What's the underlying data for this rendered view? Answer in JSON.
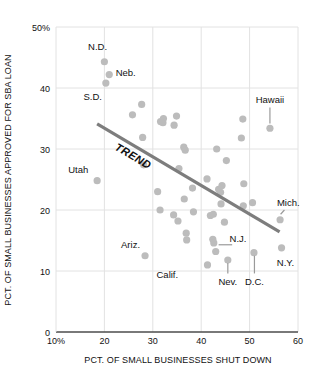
{
  "chart_data": {
    "type": "scatter",
    "title": "",
    "xlabel": "PCT. OF SMALL BUSINESSES SHUT DOWN",
    "ylabel": "PCT. OF SMALL BUSINESSES APPROVED FOR SBA LOAN",
    "xlim": [
      10,
      60
    ],
    "ylim": [
      0,
      50
    ],
    "grid": true,
    "legend": "none",
    "xticks": [
      {
        "value": 10,
        "label": "10%"
      },
      {
        "value": 20,
        "label": "20"
      },
      {
        "value": 30,
        "label": "30"
      },
      {
        "value": 40,
        "label": "40"
      },
      {
        "value": 50,
        "label": "50"
      },
      {
        "value": 60,
        "label": "60"
      }
    ],
    "yticks": [
      {
        "value": 0,
        "label": "0"
      },
      {
        "value": 10,
        "label": "10"
      },
      {
        "value": 20,
        "label": "20"
      },
      {
        "value": 30,
        "label": "30"
      },
      {
        "value": 40,
        "label": "40"
      },
      {
        "value": 50,
        "label": "50%"
      }
    ],
    "point_color": "#bcbcbc",
    "trend_color": "#7d7d7d",
    "axis_color": "#4d4d4d",
    "grid_color": "#e2e2e2",
    "points": [
      {
        "x": 20.0,
        "y": 44.3
      },
      {
        "x": 21.0,
        "y": 42.2
      },
      {
        "x": 20.3,
        "y": 40.8
      },
      {
        "x": 27.7,
        "y": 37.3
      },
      {
        "x": 25.8,
        "y": 35.6
      },
      {
        "x": 32.2,
        "y": 35.0
      },
      {
        "x": 34.9,
        "y": 35.4
      },
      {
        "x": 31.6,
        "y": 34.5
      },
      {
        "x": 32.1,
        "y": 34.3
      },
      {
        "x": 34.4,
        "y": 33.9
      },
      {
        "x": 48.6,
        "y": 34.9
      },
      {
        "x": 54.2,
        "y": 33.4
      },
      {
        "x": 27.9,
        "y": 31.9
      },
      {
        "x": 36.4,
        "y": 30.3
      },
      {
        "x": 36.7,
        "y": 29.8
      },
      {
        "x": 43.2,
        "y": 30.0
      },
      {
        "x": 48.3,
        "y": 31.8
      },
      {
        "x": 45.2,
        "y": 28.1
      },
      {
        "x": 28.1,
        "y": 27.4
      },
      {
        "x": 35.4,
        "y": 26.8
      },
      {
        "x": 18.5,
        "y": 24.8
      },
      {
        "x": 41.2,
        "y": 25.1
      },
      {
        "x": 38.2,
        "y": 23.6
      },
      {
        "x": 31.0,
        "y": 23.0
      },
      {
        "x": 43.6,
        "y": 23.4
      },
      {
        "x": 44.0,
        "y": 22.9
      },
      {
        "x": 44.3,
        "y": 24.0
      },
      {
        "x": 48.8,
        "y": 24.3
      },
      {
        "x": 36.5,
        "y": 21.8
      },
      {
        "x": 44.1,
        "y": 21.0
      },
      {
        "x": 48.7,
        "y": 20.7
      },
      {
        "x": 50.6,
        "y": 21.2
      },
      {
        "x": 31.5,
        "y": 20.0
      },
      {
        "x": 38.4,
        "y": 19.7
      },
      {
        "x": 34.3,
        "y": 19.2
      },
      {
        "x": 41.9,
        "y": 19.1
      },
      {
        "x": 42.5,
        "y": 19.3
      },
      {
        "x": 44.8,
        "y": 18.0
      },
      {
        "x": 56.3,
        "y": 18.4
      },
      {
        "x": 35.2,
        "y": 18.2
      },
      {
        "x": 36.9,
        "y": 16.2
      },
      {
        "x": 37.0,
        "y": 15.1
      },
      {
        "x": 42.4,
        "y": 15.2
      },
      {
        "x": 42.6,
        "y": 14.6
      },
      {
        "x": 56.6,
        "y": 13.8
      },
      {
        "x": 43.0,
        "y": 13.2
      },
      {
        "x": 50.9,
        "y": 13.0
      },
      {
        "x": 28.4,
        "y": 12.5
      },
      {
        "x": 45.5,
        "y": 11.8
      },
      {
        "x": 41.3,
        "y": 11.0
      }
    ],
    "trend": {
      "label": "TREND",
      "x1": 18.5,
      "y1": 34.1,
      "x2": 56.2,
      "y2": 16.4
    },
    "annotations": [
      {
        "text": "N.D.",
        "x": 18.6,
        "y": 46.8,
        "anchor": "middle",
        "leader": null
      },
      {
        "text": "Neb.",
        "x": 24.4,
        "y": 42.5,
        "anchor": "middle",
        "leader": null
      },
      {
        "text": "S.D.",
        "x": 17.6,
        "y": 38.6,
        "anchor": "middle",
        "leader": null
      },
      {
        "text": "Hawaii",
        "x": 54.2,
        "y": 38.1,
        "anchor": "middle",
        "leader": {
          "x1": 54.2,
          "y1": 36.8,
          "x2": 54.2,
          "y2": 34.2
        }
      },
      {
        "text": "Utah",
        "x": 14.6,
        "y": 26.6,
        "anchor": "middle",
        "leader": null
      },
      {
        "text": "Mich.",
        "x": 58.0,
        "y": 21.2,
        "anchor": "middle",
        "leader": {
          "x1": 57.2,
          "y1": 20.0,
          "x2": 56.4,
          "y2": 19.3
        }
      },
      {
        "text": "Ariz.",
        "x": 25.4,
        "y": 14.4,
        "anchor": "middle",
        "leader": null
      },
      {
        "text": "N.J.",
        "x": 47.6,
        "y": 15.3,
        "anchor": "middle",
        "leader": {
          "x1": 46.4,
          "y1": 14.3,
          "x2": 43.6,
          "y2": 14.3
        }
      },
      {
        "text": "N.Y.",
        "x": 57.4,
        "y": 11.4,
        "anchor": "middle",
        "leader": null
      },
      {
        "text": "Calif.",
        "x": 33.0,
        "y": 9.4,
        "anchor": "middle",
        "leader": null
      },
      {
        "text": "Nev.",
        "x": 45.5,
        "y": 8.3,
        "anchor": "middle",
        "leader": {
          "x1": 45.5,
          "y1": 9.6,
          "x2": 45.5,
          "y2": 11.3
        }
      },
      {
        "text": "D.C.",
        "x": 51.0,
        "y": 8.3,
        "anchor": "middle",
        "leader": {
          "x1": 51.0,
          "y1": 9.6,
          "x2": 51.0,
          "y2": 12.5
        }
      }
    ]
  }
}
